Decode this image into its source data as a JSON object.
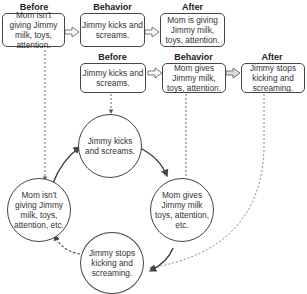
{
  "top_row": {
    "before": {
      "header": "Before",
      "text": "Mom isn't giving Jimmy milk, toys, attention."
    },
    "behavior": {
      "header": "Behavior",
      "text": "Jimmy kicks and screams."
    },
    "after": {
      "header": "After",
      "text": "Mom is giving Jimmy milk, toys, attention."
    }
  },
  "second_row": {
    "before": {
      "header": "Before",
      "text": "Jimmy kicks and screams."
    },
    "behavior": {
      "header": "Behavior",
      "text": "Mom gives Jimmy milk, toys, attention."
    },
    "after": {
      "header": "After",
      "text": "Jimmy stops kicking and screaming."
    }
  },
  "cycle": {
    "top": "Jimmy kicks and screams.",
    "right": "Mom gives Jimmy milk toys, attention, etc.",
    "bottom": "Jimmy stops kicking and screaming.",
    "left": "Mom isn't giving Jimmy milk, toys, attention, etc."
  },
  "colors": {
    "stroke": "#444444",
    "text": "#333333",
    "arrow_fill": "#ffffff"
  }
}
